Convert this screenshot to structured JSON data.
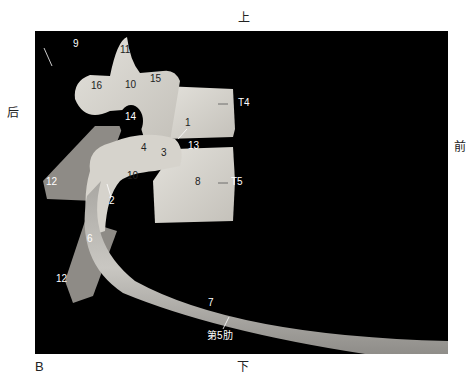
{
  "orientation": {
    "top": "上",
    "bottom": "下",
    "left": "后",
    "right": "前"
  },
  "figure_letter": "B",
  "labels": [
    {
      "id": "9",
      "text": "9"
    },
    {
      "id": "11",
      "text": "11"
    },
    {
      "id": "16",
      "text": "16"
    },
    {
      "id": "10a",
      "text": "10"
    },
    {
      "id": "15",
      "text": "15"
    },
    {
      "id": "T4",
      "text": "T4"
    },
    {
      "id": "14",
      "text": "14"
    },
    {
      "id": "1",
      "text": "1"
    },
    {
      "id": "4",
      "text": "4"
    },
    {
      "id": "3",
      "text": "3"
    },
    {
      "id": "13",
      "text": "13"
    },
    {
      "id": "12a",
      "text": "12"
    },
    {
      "id": "10b",
      "text": "10"
    },
    {
      "id": "8",
      "text": "8"
    },
    {
      "id": "T5",
      "text": "T5"
    },
    {
      "id": "2",
      "text": "2"
    },
    {
      "id": "6",
      "text": "6"
    },
    {
      "id": "12b",
      "text": "12"
    },
    {
      "id": "7",
      "text": "7"
    },
    {
      "id": "rib5",
      "text": "第5肋"
    }
  ],
  "colors": {
    "background": "#000000",
    "bone": "#d9d6cf",
    "bone_shadow": "#9c9993",
    "page": "#ffffff"
  }
}
